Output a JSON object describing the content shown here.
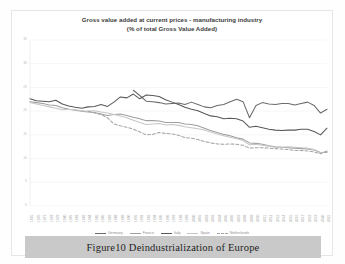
{
  "figure": {
    "caption": "Figure10  Deindustrialization of Europe",
    "caption_bar_color": "#c9c9c9"
  },
  "chart_data": {
    "type": "line",
    "title": "Gross value added at current prices - manufacturing industry",
    "subtitle": "(% of total Gross Value Added)",
    "xlabel": "",
    "ylabel": "",
    "ylim": [
      0,
      35
    ],
    "yticks": [
      0,
      5,
      10,
      15,
      20,
      25,
      30,
      35
    ],
    "ytick_labels": [
      "0",
      "5",
      "10",
      "15",
      "20",
      "25",
      "30",
      "35"
    ],
    "grid": true,
    "legend_position": "bottom",
    "x": [
      "1975",
      "1976",
      "1977",
      "1978",
      "1979",
      "1980",
      "1981",
      "1982",
      "1983",
      "1984",
      "1985",
      "1986",
      "1987",
      "1988",
      "1989",
      "1990",
      "1991",
      "1992",
      "1993",
      "1994",
      "1995",
      "1996",
      "1997",
      "1998",
      "1999",
      "2000",
      "2001",
      "2002",
      "2003",
      "2004",
      "2005",
      "2006",
      "2007",
      "2008",
      "2009",
      "2010",
      "2011",
      "2012",
      "2013",
      "2014",
      "2015",
      "2016",
      "2017",
      "2018",
      "2019",
      "2020",
      "2021"
    ],
    "series": [
      {
        "name": "Germany",
        "color": "#6b6b6b",
        "style": "solid",
        "values": [
          null,
          null,
          null,
          null,
          null,
          null,
          null,
          null,
          null,
          null,
          null,
          null,
          null,
          null,
          null,
          null,
          24.4,
          23.3,
          22.1,
          22.0,
          21.8,
          21.5,
          21.6,
          21.7,
          21.4,
          21.9,
          21.4,
          20.9,
          20.7,
          21.2,
          21.4,
          22.0,
          22.5,
          22.0,
          18.6,
          21.2,
          21.8,
          21.5,
          21.4,
          21.6,
          21.6,
          21.3,
          21.6,
          21.9,
          21.2,
          19.6,
          20.4
        ]
      },
      {
        "name": "France",
        "color": "#9f9f9f",
        "style": "solid",
        "values": [
          22.0,
          21.8,
          21.6,
          21.3,
          21.2,
          20.7,
          20.4,
          20.2,
          20.0,
          19.8,
          19.7,
          19.4,
          19.1,
          19.3,
          19.4,
          19.1,
          18.7,
          18.4,
          18.0,
          18.0,
          17.9,
          17.6,
          17.6,
          17.6,
          17.3,
          17.2,
          16.9,
          16.4,
          15.9,
          15.5,
          15.1,
          14.8,
          14.4,
          14.1,
          13.3,
          13.2,
          13.0,
          12.7,
          12.5,
          12.4,
          12.3,
          12.2,
          12.1,
          12.0,
          11.8,
          11.3,
          11.3
        ]
      },
      {
        "name": "Italy",
        "color": "#585858",
        "style": "solid",
        "values": [
          22.6,
          22.2,
          22.1,
          22.0,
          22.3,
          21.5,
          21.1,
          20.8,
          20.6,
          20.9,
          21.0,
          21.4,
          21.0,
          21.9,
          23.0,
          22.8,
          23.6,
          22.6,
          23.4,
          23.3,
          23.1,
          22.4,
          21.9,
          21.4,
          20.8,
          20.4,
          20.1,
          19.5,
          19.0,
          18.8,
          18.4,
          18.5,
          18.4,
          17.9,
          16.6,
          16.8,
          16.5,
          16.2,
          16.0,
          15.9,
          16.0,
          16.0,
          16.2,
          16.2,
          15.7,
          15.0,
          16.4
        ]
      },
      {
        "name": "Spain",
        "color": "#c6c6c6",
        "style": "solid",
        "values": [
          21.8,
          21.5,
          21.2,
          20.9,
          20.6,
          20.3,
          20.4,
          20.3,
          20.1,
          20.0,
          20.1,
          19.8,
          19.6,
          19.3,
          19.0,
          18.6,
          18.1,
          17.6,
          17.2,
          17.3,
          17.4,
          17.1,
          17.2,
          17.0,
          16.7,
          16.5,
          16.3,
          16.0,
          15.6,
          15.2,
          14.8,
          14.5,
          14.2,
          13.8,
          12.9,
          13.0,
          12.8,
          12.6,
          12.4,
          12.4,
          12.5,
          12.4,
          12.3,
          12.2,
          11.9,
          11.2,
          11.5
        ]
      },
      {
        "name": "Netherlands",
        "color": "#a5a5a5",
        "style": "dashed",
        "values": [
          null,
          null,
          null,
          null,
          null,
          null,
          null,
          null,
          null,
          20.0,
          19.6,
          19.3,
          18.6,
          17.3,
          16.9,
          16.6,
          16.2,
          15.6,
          15.0,
          15.1,
          15.5,
          15.3,
          15.2,
          14.9,
          14.4,
          14.3,
          14.0,
          13.6,
          13.3,
          13.1,
          13.0,
          13.1,
          13.0,
          12.8,
          12.2,
          12.3,
          12.3,
          12.2,
          12.1,
          12.0,
          11.9,
          11.7,
          11.7,
          11.6,
          11.4,
          11.0,
          11.6
        ]
      }
    ],
    "legend": [
      {
        "label": "Germany",
        "color": "#6b6b6b",
        "style": "solid"
      },
      {
        "label": "France",
        "color": "#9f9f9f",
        "style": "solid"
      },
      {
        "label": "Italy",
        "color": "#585858",
        "style": "solid"
      },
      {
        "label": "Spain",
        "color": "#c6c6c6",
        "style": "solid"
      },
      {
        "label": "Netherlands",
        "color": "#a5a5a5",
        "style": "dashed"
      }
    ]
  }
}
